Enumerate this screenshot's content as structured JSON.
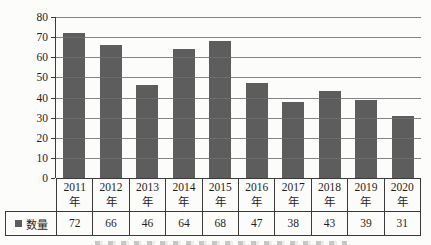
{
  "chart_data": {
    "type": "bar",
    "title": "",
    "categories": [
      {
        "year": "2011",
        "suffix": "年"
      },
      {
        "year": "2012",
        "suffix": "年"
      },
      {
        "year": "2013",
        "suffix": "年"
      },
      {
        "year": "2014",
        "suffix": "年"
      },
      {
        "year": "2015",
        "suffix": "年"
      },
      {
        "year": "2016",
        "suffix": "年"
      },
      {
        "year": "2017",
        "suffix": "年"
      },
      {
        "year": "2018",
        "suffix": "年"
      },
      {
        "year": "2019",
        "suffix": "年"
      },
      {
        "year": "2020",
        "suffix": "年"
      }
    ],
    "series": [
      {
        "name": "数量",
        "values": [
          72,
          66,
          46,
          64,
          68,
          47,
          38,
          43,
          39,
          31
        ]
      }
    ],
    "ylim": [
      0,
      80
    ],
    "yticks": [
      0,
      10,
      20,
      30,
      40,
      50,
      60,
      70,
      80
    ],
    "grid": "horizontal, drawn over bars",
    "legend": {
      "label": "数量",
      "position": "table-row-header-bottom-left"
    },
    "data_table_shown": true,
    "colors": {
      "bar": "#5d5d5d",
      "gridline": "#6f6f6f",
      "border": "#3a3a3a",
      "text": "#1f1f1f",
      "background": "#fcfcfb"
    }
  }
}
